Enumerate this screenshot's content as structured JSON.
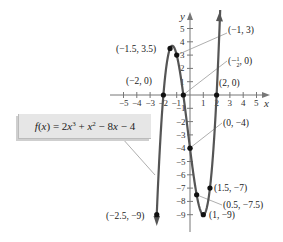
{
  "chart_data": {
    "type": "line",
    "title": "",
    "function_label": "f(x) = 2x^3 + x^2 - 8x - 4",
    "xlabel": "x",
    "ylabel": "y",
    "xlim": [
      -5,
      5
    ],
    "ylim": [
      -9,
      5
    ],
    "x_ticks": [
      -5,
      -4,
      -3,
      -2,
      -1,
      1,
      2,
      3,
      4,
      5
    ],
    "y_ticks": [
      5,
      4,
      3,
      2,
      1,
      -1,
      -2,
      -3,
      -4,
      -5,
      -6,
      -7,
      -8,
      -9
    ],
    "grid": false,
    "highlighted_points": [
      {
        "x": -2.5,
        "y": -9,
        "label": "(−2.5, −9)"
      },
      {
        "x": -2,
        "y": 0,
        "label": "(−2, 0)"
      },
      {
        "x": -1.5,
        "y": 3.5,
        "label": "(−1.5, 3.5)"
      },
      {
        "x": -1,
        "y": 3,
        "label": "(−1, 3)"
      },
      {
        "x": -0.5,
        "y": 0,
        "label": "(−½, 0)"
      },
      {
        "x": 0,
        "y": -4,
        "label": "(0, −4)"
      },
      {
        "x": 0.5,
        "y": -7.5,
        "label": "(0.5, −7.5)"
      },
      {
        "x": 1,
        "y": -9,
        "label": "(1, −9)"
      },
      {
        "x": 1.5,
        "y": -7,
        "label": "(1.5, −7)"
      },
      {
        "x": 2,
        "y": 0,
        "label": "(2, 0)"
      }
    ]
  },
  "labels": {
    "x_axis": "x",
    "y_axis": "y",
    "formula": {
      "f": "f",
      "x": "x",
      "eq": " = 2",
      "x3": "x",
      "p3": "3",
      "plus": " + ",
      "x2": "x",
      "p2": "2",
      "minus8": " − 8",
      "x1": "x",
      "minus4": " − 4"
    },
    "points": {
      "p_m25_m9": "(−2.5, −9)",
      "p_m2_0": "(−2, 0)",
      "p_m15_35": "(−1.5, 3.5)",
      "p_m1_3": "(−1, 3)",
      "p_mhalf_0_open": "(−",
      "p_mhalf_0_close": ", 0)",
      "half_num": "1",
      "half_den": "2",
      "p_0_m4": "(0, −4)",
      "p_05_m75": "(0.5, −7.5)",
      "p_1_m9": "(1, −9)",
      "p_15_m7": "(1.5, −7)",
      "p_2_0": "(2, 0)"
    },
    "x_ticks": [
      "−5",
      "−4",
      "−3",
      "−2",
      "−1",
      "1",
      "2",
      "3",
      "4",
      "5"
    ],
    "y_ticks": [
      "5",
      "4",
      "3",
      "2",
      "1",
      "−1",
      "−2",
      "−3",
      "−4",
      "−5",
      "−6",
      "−7",
      "−8",
      "−9"
    ]
  }
}
